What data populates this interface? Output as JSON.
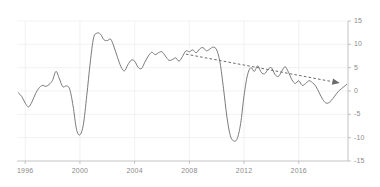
{
  "chart_data": {
    "type": "line",
    "title": "",
    "subtitle": "",
    "xlabel": "",
    "ylabel": "",
    "xlim": [
      1995.4,
      2019.6
    ],
    "ylim": [
      -15,
      15
    ],
    "grid": true,
    "legend": null,
    "x_ticks": [
      "1996",
      "2000",
      "2004",
      "2008",
      "2012",
      "2016"
    ],
    "x_tick_values": [
      1996,
      2000,
      2004,
      2008,
      2012,
      2016
    ],
    "y_ticks": [
      "15",
      "10",
      "5",
      "0",
      "-5",
      "-10",
      "-15"
    ],
    "y_tick_values": [
      15,
      10,
      5,
      0,
      -5,
      -10,
      -15
    ],
    "series": [
      {
        "name": "main-series",
        "type": "line",
        "style": "solid",
        "color": "#6b6b6b",
        "x": [
          1995.5,
          1995.75,
          1996.0,
          1996.25,
          1996.5,
          1996.75,
          1997.0,
          1997.25,
          1997.5,
          1997.75,
          1998.0,
          1998.25,
          1998.5,
          1998.75,
          1999.0,
          1999.25,
          1999.5,
          1999.75,
          2000.0,
          2000.25,
          2000.5,
          2000.75,
          2001.0,
          2001.25,
          2001.5,
          2001.75,
          2002.0,
          2002.25,
          2002.5,
          2002.75,
          2003.0,
          2003.25,
          2003.5,
          2003.75,
          2004.0,
          2004.25,
          2004.5,
          2004.75,
          2005.0,
          2005.25,
          2005.5,
          2005.75,
          2006.0,
          2006.25,
          2006.5,
          2006.75,
          2007.0,
          2007.25,
          2007.5,
          2007.75,
          2008.0,
          2008.25,
          2008.5,
          2008.75,
          2009.0,
          2009.25,
          2009.5,
          2009.75,
          2010.0,
          2010.25,
          2010.5,
          2010.75,
          2011.0,
          2011.25,
          2011.5,
          2011.75,
          2012.0,
          2012.25,
          2012.5,
          2012.75,
          2013.0,
          2013.25,
          2013.5,
          2013.75,
          2014.0,
          2014.25,
          2014.5,
          2014.75,
          2015.0,
          2015.25,
          2015.5,
          2015.75,
          2016.0,
          2016.25,
          2016.5,
          2016.75,
          2017.0,
          2017.25,
          2017.5,
          2017.75,
          2018.0,
          2018.25,
          2018.5,
          2018.75,
          2019.0,
          2019.25,
          2019.5
        ],
        "y": [
          -0.4,
          -1.2,
          -2.6,
          -3.4,
          -2.3,
          -0.6,
          0.6,
          1.2,
          1.0,
          1.4,
          2.3,
          4.2,
          2.6,
          0.9,
          1.1,
          0.4,
          -3.2,
          -8.2,
          -9.4,
          -7.2,
          -1.0,
          6.0,
          11.4,
          12.4,
          12.2,
          11.0,
          10.8,
          11.1,
          9.4,
          7.2,
          5.2,
          4.3,
          5.6,
          6.6,
          6.4,
          5.1,
          4.8,
          6.2,
          7.5,
          8.3,
          7.8,
          8.2,
          8.4,
          7.5,
          6.6,
          6.7,
          7.1,
          6.4,
          7.4,
          8.6,
          8.4,
          8.8,
          8.2,
          9.0,
          9.3,
          8.6,
          9.0,
          9.4,
          8.8,
          6.0,
          0.5,
          -5.6,
          -9.6,
          -10.7,
          -10.2,
          -7.0,
          -1.0,
          3.4,
          5.0,
          4.2,
          5.4,
          4.0,
          3.7,
          4.6,
          5.0,
          3.6,
          3.1,
          4.2,
          5.2,
          4.0,
          2.4,
          1.6,
          2.2,
          1.2,
          1.6,
          2.2,
          1.8,
          1.0,
          -0.4,
          -1.8,
          -2.6,
          -2.4,
          -1.6,
          -0.6,
          0.2,
          0.8,
          1.4
        ]
      },
      {
        "name": "trend-line",
        "type": "line",
        "style": "dashed",
        "color": "#6b6b6b",
        "arrow_end": true,
        "x": [
          2007.75,
          2019.0
        ],
        "y": [
          7.9,
          1.7
        ]
      }
    ]
  },
  "axes": {
    "y_axis_side": "right",
    "x_axis_side": "bottom",
    "axis_color": "#b5b5b5",
    "grid_color": "#ededed",
    "tick_label_color": "#8a8a8a"
  }
}
